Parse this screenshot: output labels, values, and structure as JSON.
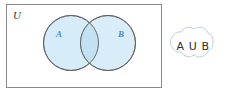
{
  "figure": {
    "universe": {
      "label": "U",
      "name": "universal-set-rectangle"
    },
    "sets": [
      {
        "id": "A",
        "label": "A",
        "name": "set-a-circle"
      },
      {
        "id": "B",
        "label": "B",
        "name": "set-b-circle"
      }
    ],
    "callout": {
      "label": "A U B",
      "letter_a": "A",
      "union_symbol": "U",
      "letter_b": "B",
      "shape": "cloud"
    },
    "colors": {
      "set_fill": "#d6ecf8",
      "overlap_fill": "#c2e2f3",
      "set_stroke": "#5d5d5d",
      "rect_stroke": "#8a8a8a",
      "label_blue": "#4a8fd0",
      "cloud_stroke": "#b9c9de",
      "text_dark": "#2e2e2e",
      "background": "#ffffff"
    },
    "geometry": {
      "rect": {
        "x": 6,
        "y": 4,
        "width": 156,
        "height": 84
      },
      "circle_a": {
        "cx": 71,
        "cy": 43,
        "r": 27.5
      },
      "circle_b": {
        "cx": 108,
        "cy": 43,
        "r": 27.5
      },
      "cloud_center": {
        "cx": 193,
        "cy": 46
      }
    }
  }
}
